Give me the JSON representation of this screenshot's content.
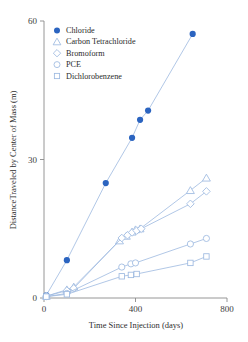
{
  "chart_data": {
    "type": "scatter",
    "title": "",
    "xlabel": "Time Since Injection (days)",
    "ylabel": "DistanceTraveled by Center of Mass (m)",
    "xlim": [
      0,
      800
    ],
    "ylim": [
      0,
      60
    ],
    "xticks": [
      0,
      400,
      800
    ],
    "yticks": [
      0,
      30,
      60
    ],
    "xtick_labels": [
      "0",
      "400",
      "800"
    ],
    "ytick_labels": [
      "0",
      "30",
      "60"
    ],
    "grid": false,
    "legend_position": "top-left",
    "series": [
      {
        "name": "Chloride",
        "marker": "circle-filled",
        "color": "#2b64c0",
        "line_color": "#9db9e0",
        "x": [
          10,
          100,
          270,
          385,
          420,
          455,
          650
        ],
        "y": [
          0.6,
          8.2,
          24.9,
          34.7,
          38.6,
          40.6,
          57.2
        ]
      },
      {
        "name": "Carbon Tetrachloride",
        "marker": "triangle",
        "color": "#9db9e0",
        "line_color": "#9db9e0",
        "x": [
          10,
          100,
          130,
          330,
          360,
          385,
          400,
          420,
          640,
          710
        ],
        "y": [
          0.4,
          1.8,
          2.4,
          12.4,
          13.4,
          14.3,
          14.8,
          15.0,
          23.3,
          26.0
        ]
      },
      {
        "name": "Bromoform",
        "marker": "diamond",
        "color": "#9db9e0",
        "line_color": "#9db9e0",
        "x": [
          10,
          100,
          130,
          340,
          365,
          385,
          405,
          425,
          640,
          710
        ],
        "y": [
          0.4,
          1.6,
          2.1,
          13.0,
          13.6,
          14.2,
          14.6,
          15.0,
          20.4,
          23.1
        ]
      },
      {
        "name": "PCE",
        "marker": "circle-open",
        "color": "#9db9e0",
        "line_color": "#9db9e0",
        "x": [
          10,
          100,
          340,
          380,
          400,
          640,
          710
        ],
        "y": [
          0.3,
          1.0,
          6.7,
          7.4,
          7.6,
          11.7,
          12.9
        ]
      },
      {
        "name": "Dichlorobenzene",
        "marker": "square",
        "color": "#9db9e0",
        "line_color": "#9db9e0",
        "x": [
          10,
          100,
          340,
          380,
          405,
          640,
          710
        ],
        "y": [
          0.3,
          0.8,
          4.7,
          5.0,
          5.2,
          7.6,
          9.0
        ]
      }
    ],
    "legend": [
      {
        "label": "Chloride",
        "marker": "circle-filled",
        "color": "#2b64c0"
      },
      {
        "label": "Carbon Tetrachloride",
        "marker": "triangle",
        "color": "#9db9e0"
      },
      {
        "label": "Bromoform",
        "marker": "diamond",
        "color": "#9db9e0"
      },
      {
        "label": "PCE",
        "marker": "circle-open",
        "color": "#9db9e0"
      },
      {
        "label": "Dichlorobenzene",
        "marker": "square",
        "color": "#9db9e0"
      }
    ]
  }
}
